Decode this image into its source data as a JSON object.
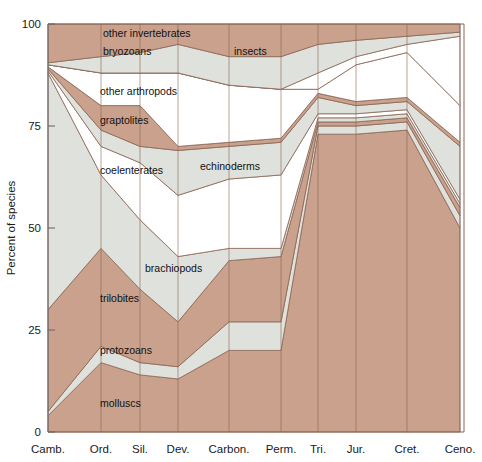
{
  "chart_data": {
    "type": "area",
    "title": "",
    "xlabel": "",
    "ylabel": "Percent of species",
    "ylim": [
      0,
      100
    ],
    "yticks": [
      0,
      25,
      50,
      75,
      100
    ],
    "ytick_labels": [
      "0",
      "25",
      "50",
      "75",
      "100"
    ],
    "grid": true,
    "legend_position": "inline-labels",
    "stacked": true,
    "normalized_percent": true,
    "categories": [
      "Camb.",
      "Ord.",
      "Sil.",
      "Dev.",
      "Carbon.",
      "Perm.",
      "Tri.",
      "Jur.",
      "Cret.",
      "Ceno."
    ],
    "x_positions_px": [
      48,
      101,
      140,
      178,
      229,
      281,
      318,
      356,
      407,
      460
    ],
    "series": [
      {
        "name": "molluscs",
        "color": "#c9a18d",
        "values": [
          4,
          17,
          14,
          13,
          20,
          20,
          73,
          73,
          74,
          50
        ]
      },
      {
        "name": "protozoans",
        "color": "#dfe1dc",
        "values": [
          5,
          21,
          17,
          16,
          27,
          27,
          75,
          75,
          76,
          53
        ]
      },
      {
        "name": "brachiopods",
        "color": "#c9a18d",
        "values": [
          30,
          45,
          35,
          27,
          42,
          43,
          76,
          76,
          77,
          55
        ]
      },
      {
        "name": "trilobites",
        "color": "#dfe1dc",
        "values": [
          88,
          63,
          52,
          43,
          45,
          45,
          77,
          77,
          78,
          56
        ]
      },
      {
        "name": "coelenterates",
        "color": "#ffffff",
        "values": [
          88.5,
          70,
          66,
          58,
          62,
          63,
          78,
          78,
          79,
          57
        ]
      },
      {
        "name": "echinoderms",
        "color": "#dfe1dc",
        "values": [
          89,
          74,
          70,
          69,
          70,
          71,
          82,
          80,
          81,
          70
        ]
      },
      {
        "name": "graptolites",
        "color": "#c9a18d",
        "values": [
          89.5,
          80,
          80,
          70,
          71,
          72,
          83,
          81,
          82,
          71
        ]
      },
      {
        "name": "other arthropods",
        "color": "#ffffff",
        "values": [
          90,
          88,
          88,
          88,
          85,
          84,
          84,
          90,
          93,
          80
        ]
      },
      {
        "name": "insects",
        "color": "#ffffff",
        "values": [
          90,
          88,
          88,
          88,
          85,
          84,
          88,
          92,
          95,
          97
        ]
      },
      {
        "name": "bryozoans",
        "color": "#dfe1dc",
        "values": [
          90.5,
          92,
          93,
          95,
          92,
          92,
          95,
          96,
          97,
          98
        ]
      },
      {
        "name": "other invertebrates",
        "color": "#c9a18d",
        "values": [
          100,
          100,
          100,
          100,
          100,
          100,
          100,
          100,
          100,
          100
        ]
      }
    ],
    "inline_labels": [
      {
        "text": "other invertebrates",
        "x": 103,
        "y": 37
      },
      {
        "text": "bryozoans",
        "x": 103,
        "y": 55
      },
      {
        "text": "insects",
        "x": 234,
        "y": 55
      },
      {
        "text": "other arthropods",
        "x": 100,
        "y": 95
      },
      {
        "text": "graptolites",
        "x": 100,
        "y": 124
      },
      {
        "text": "coelenterates",
        "x": 100,
        "y": 174
      },
      {
        "text": "echinoderms",
        "x": 200,
        "y": 170
      },
      {
        "text": "brachiopods",
        "x": 145,
        "y": 272
      },
      {
        "text": "trilobites",
        "x": 100,
        "y": 302
      },
      {
        "text": "protozoans",
        "x": 100,
        "y": 354
      },
      {
        "text": "molluscs",
        "x": 100,
        "y": 407
      }
    ]
  },
  "axes": {
    "y_axis_title": "Percent of species",
    "y_tick_100": "100",
    "y_tick_75": "75",
    "y_tick_50": "50",
    "y_tick_25": "25",
    "y_tick_0": "0",
    "x_labels": {
      "camb": "Camb.",
      "ord": "Ord.",
      "sil": "Sil.",
      "dev": "Dev.",
      "carbon": "Carbon.",
      "perm": "Perm.",
      "tri": "Tri.",
      "jur": "Jur.",
      "cret": "Cret.",
      "ceno": "Ceno."
    }
  },
  "colors": {
    "brown": "#c9a18d",
    "grey": "#dfe1dc",
    "white": "#ffffff",
    "outline": "#8a6553",
    "axis": "#6a6a6a",
    "background": "#ffffff"
  }
}
